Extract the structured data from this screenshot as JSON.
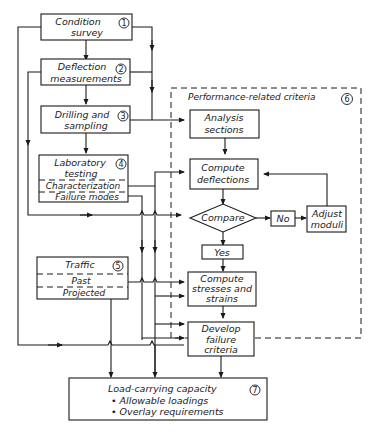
{
  "diagram": {
    "nodes": {
      "condition_survey": {
        "line1": "Condition",
        "line2": "survey",
        "number": "1"
      },
      "deflection_measurements": {
        "line1": "Deflection",
        "line2": "measurements",
        "number": "2"
      },
      "drilling_sampling": {
        "line1": "Drilling and",
        "line2": "sampling",
        "number": "3"
      },
      "laboratory_testing": {
        "line1": "Laboratory",
        "line2": "testing",
        "number": "4",
        "sub1": "Characterization",
        "sub2": "Failure modes"
      },
      "traffic": {
        "line1": "Traffic",
        "number": "5",
        "sub1": "Past",
        "sub2": "Projected"
      },
      "performance_group": {
        "label": "Performance-related criteria",
        "number": "6"
      },
      "analysis_sections": {
        "line1": "Analysis",
        "line2": "sections"
      },
      "compute_deflections": {
        "line1": "Compute",
        "line2": "deflections"
      },
      "compare": {
        "label": "Compare"
      },
      "no": {
        "label": "No"
      },
      "yes": {
        "label": "Yes"
      },
      "adjust_moduli": {
        "line1": "Adjust",
        "line2": "moduli"
      },
      "compute_stresses": {
        "line1": "Compute",
        "line2": "stresses and",
        "line3": "strains"
      },
      "develop_failure": {
        "line1": "Develop",
        "line2": "failure",
        "line3": "criteria"
      },
      "load_capacity": {
        "title": "Load-carrying capacity",
        "bullet1": "• Allowable loadings",
        "bullet2": "• Overlay requirements",
        "number": "7"
      }
    },
    "edges": [
      [
        "condition_survey",
        "deflection_measurements"
      ],
      [
        "deflection_measurements",
        "drilling_sampling"
      ],
      [
        "drilling_sampling",
        "laboratory_testing"
      ],
      [
        "drilling_sampling",
        "analysis_sections"
      ],
      [
        "analysis_sections",
        "compute_deflections"
      ],
      [
        "compute_deflections",
        "compare"
      ],
      [
        "compare",
        "no"
      ],
      [
        "no",
        "adjust_moduli"
      ],
      [
        "adjust_moduli",
        "compute_deflections"
      ],
      [
        "compare",
        "yes"
      ],
      [
        "yes",
        "compute_stresses"
      ],
      [
        "compute_stresses",
        "develop_failure"
      ],
      [
        "develop_failure",
        "load_capacity"
      ],
      [
        "laboratory_testing",
        "compute_deflections"
      ],
      [
        "laboratory_testing",
        "compare"
      ],
      [
        "traffic",
        "compute_stresses"
      ],
      [
        "traffic",
        "develop_failure"
      ],
      [
        "traffic",
        "load_capacity"
      ],
      [
        "condition_survey",
        "load_capacity"
      ],
      [
        "deflection_measurements",
        "compare"
      ]
    ]
  }
}
